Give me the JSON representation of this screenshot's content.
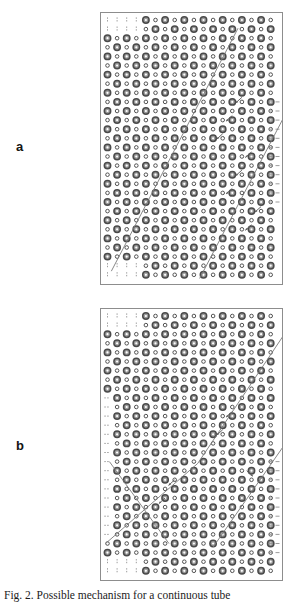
{
  "figure": {
    "caption_prefix": "Fig. 2.",
    "caption_text": "Possible mechanism for a continuous tube"
  },
  "panels": [
    {
      "id": "a",
      "label": "a",
      "frame": {
        "x": 100,
        "y": 12,
        "w": 183,
        "h": 273
      },
      "boundary_style": "single diagonal staircase with Y-fork near lower right"
    },
    {
      "id": "b",
      "label": "b",
      "frame": {
        "x": 100,
        "y": 308,
        "w": 183,
        "h": 273
      },
      "boundary_style": "V-shaped (chevron) diagonal boundary with vertex near centre"
    }
  ],
  "markers": {
    "large_label": "large-circle",
    "small_label": "small-circle",
    "ring_color": "#4a4a4a",
    "fill_color": "#9b9b9b",
    "hollow_color": "#ffffff",
    "large_diameter_px": 6.4,
    "small_diameter_px": 3.6
  },
  "lines": {
    "boundary_color": "#7a7a7a",
    "dash_color": "#8a8a8a",
    "arrow_color": "#5e5e5e"
  },
  "chart_data": {
    "type": "scatter",
    "title": "",
    "xlabel": "",
    "ylabel": "",
    "grid": false,
    "legend": null,
    "grid_cols": 19,
    "grid_rows": 29,
    "col_spacing_px": 9.6,
    "row_spacing_px": 9.1,
    "panels": [
      {
        "name": "a",
        "boundary_vertices": [
          [
            1.0,
            27.2
          ],
          [
            13.0,
            1.5
          ],
          [
            13.0,
            1.5
          ],
          [
            18.6,
            1.5
          ]
        ],
        "boundary_path": "diagonal from lower-left to upper-right",
        "secondary_boundary": [
          [
            10.2,
            28.0
          ],
          [
            18.6,
            11.4
          ]
        ],
        "arrows": [
          {
            "x": 14.0,
            "y": 8.5,
            "dx": -1.0,
            "dy": 1.0
          },
          {
            "x": 13.0,
            "y": 10.5,
            "dx": -1.0,
            "dy": 1.0
          },
          {
            "x": 12.0,
            "y": 12.5,
            "dx": -1.0,
            "dy": 1.0
          },
          {
            "x": 15.0,
            "y": 14.5,
            "dx": -1.0,
            "dy": 1.0
          },
          {
            "x": 14.0,
            "y": 16.5,
            "dx": -1.0,
            "dy": 1.0
          },
          {
            "x": 13.0,
            "y": 18.5,
            "dx": -1.0,
            "dy": 1.0
          },
          {
            "x": 16.0,
            "y": 20.5,
            "dx": -1.0,
            "dy": 1.0
          },
          {
            "x": 15.0,
            "y": 22.5,
            "dx": -1.0,
            "dy": 1.0
          }
        ]
      },
      {
        "name": "b",
        "boundary_vertices": [
          [
            1.0,
            16.0
          ],
          [
            9.4,
            16.0
          ],
          [
            9.4,
            16.0
          ],
          [
            18.6,
            3.0
          ]
        ],
        "boundary_path": "chevron: up-right from lower-left, vertex at centre, up-right again",
        "arrows": [
          {
            "x": 13.0,
            "y": 10.5,
            "dx": -1.0,
            "dy": 1.0
          },
          {
            "x": 12.0,
            "y": 12.5,
            "dx": -1.0,
            "dy": 1.0
          },
          {
            "x": 14.5,
            "y": 17.0,
            "dx": 1.0,
            "dy": 1.0
          },
          {
            "x": 7.0,
            "y": 18.0,
            "dx": -1.0,
            "dy": 1.0
          },
          {
            "x": 6.0,
            "y": 20.0,
            "dx": -1.0,
            "dy": 1.0
          }
        ]
      }
    ]
  }
}
